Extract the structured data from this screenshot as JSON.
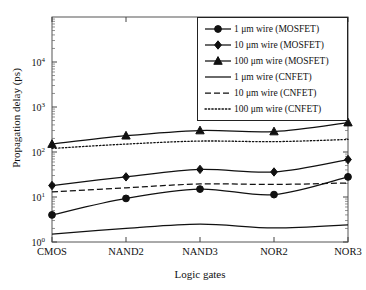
{
  "chart_data": {
    "type": "line",
    "title": "",
    "xlabel": "Logic gates",
    "ylabel": "Propagation delay (ps)",
    "categories": [
      "CMOS",
      "NAND2",
      "NAND3",
      "NOR2",
      "NOR3"
    ],
    "yscale": "log",
    "ylim": [
      1,
      30000
    ],
    "ytick_labels": [
      "10⁰",
      "10¹",
      "10²",
      "10³",
      "10⁴"
    ],
    "ytick_values": [
      1,
      10,
      100,
      1000,
      10000
    ],
    "grid": false,
    "legend_position": "top-right",
    "series": [
      {
        "name": "1 μm wire (MOSFET)",
        "marker": "circle",
        "linestyle": "solid",
        "color": "#111111",
        "values": [
          4.0,
          9.3,
          15.0,
          11.3,
          28.0
        ]
      },
      {
        "name": "10 μm wire (MOSFET)",
        "marker": "diamond",
        "linestyle": "solid",
        "color": "#111111",
        "values": [
          18.0,
          28.0,
          41.0,
          36.0,
          68.0
        ]
      },
      {
        "name": "100 μm wire (MOSFET)",
        "marker": "triangle",
        "linestyle": "solid",
        "color": "#111111",
        "values": [
          150.0,
          230.0,
          300.0,
          285.0,
          450.0
        ]
      },
      {
        "name": "1 μm wire (CNFET)",
        "marker": "none",
        "linestyle": "solid",
        "color": "#111111",
        "values": [
          1.5,
          2.0,
          2.5,
          2.05,
          2.4
        ]
      },
      {
        "name": "10 μm wire (CNFET)",
        "marker": "none",
        "linestyle": "dashed",
        "color": "#111111",
        "values": [
          13.0,
          16.0,
          19.5,
          19.0,
          20.5
        ]
      },
      {
        "name": "100 μm wire (CNFET)",
        "marker": "none",
        "linestyle": "dotted",
        "color": "#111111",
        "values": [
          120.0,
          150.0,
          175.0,
          170.0,
          190.0
        ]
      }
    ]
  }
}
